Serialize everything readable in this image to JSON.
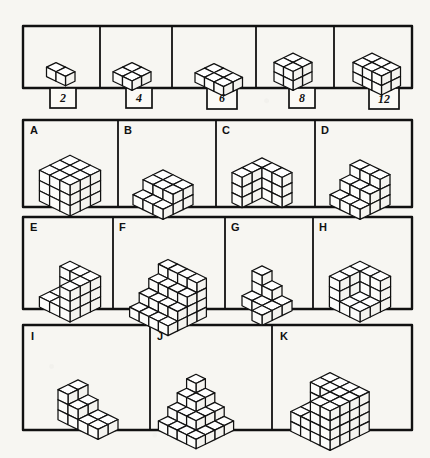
{
  "page": {
    "background_color": "#f7f6f2",
    "ink_color": "#111111",
    "face_top_color": "#ffffff",
    "face_left_color": "#ffffff",
    "face_right_color": "#ffffff"
  },
  "reference_row": {
    "name": "cube-count-reference-row",
    "cells": [
      {
        "label": "2",
        "cubes": 2,
        "dims": "2x1x1"
      },
      {
        "label": "4",
        "cubes": 4,
        "dims": "2x2x1"
      },
      {
        "label": "6",
        "cubes": 6,
        "dims": "3x2x1"
      },
      {
        "label": "8",
        "cubes": 8,
        "dims": "2x2x2"
      },
      {
        "label": "12",
        "cubes": 12,
        "dims": "3x2x2"
      }
    ]
  },
  "figure_rows": [
    {
      "row_name": "figure-row-1",
      "figures": [
        {
          "label": "A",
          "shape": "full-cube-3x3x3"
        },
        {
          "label": "B",
          "shape": "two-step-stair"
        },
        {
          "label": "C",
          "shape": "l-shaped-wall"
        },
        {
          "label": "D",
          "shape": "corner-stair"
        }
      ]
    },
    {
      "row_name": "figure-row-2",
      "figures": [
        {
          "label": "E",
          "shape": "notched-cube"
        },
        {
          "label": "F",
          "shape": "wide-staircase"
        },
        {
          "label": "G",
          "shape": "sparse-steps"
        },
        {
          "label": "H",
          "shape": "notched-cube-large"
        }
      ]
    },
    {
      "row_name": "figure-row-3",
      "figures": [
        {
          "label": "I",
          "shape": "low-staircase"
        },
        {
          "label": "J",
          "shape": "pyramid-staircase"
        },
        {
          "label": "K",
          "shape": "notched-cube-4x4x4"
        }
      ]
    }
  ]
}
